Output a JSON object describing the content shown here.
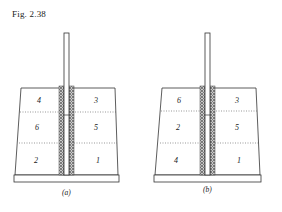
{
  "figure": {
    "title": "Fig. 2.38",
    "panels": [
      {
        "id": "a",
        "caption": "(a)",
        "weld_sequence": {
          "top_left": "4",
          "top_right": "3",
          "middle_left": "6",
          "middle_right": "5",
          "bottom_left": "2",
          "bottom_right": "1"
        }
      },
      {
        "id": "b",
        "caption": "(b)",
        "weld_sequence": {
          "top_left": "6",
          "top_right": "3",
          "middle_left": "2",
          "middle_right": "5",
          "bottom_left": "4",
          "bottom_right": "1"
        }
      }
    ]
  },
  "colors": {
    "line": "#333333",
    "weld": "#888888",
    "background": "#ffffff"
  }
}
